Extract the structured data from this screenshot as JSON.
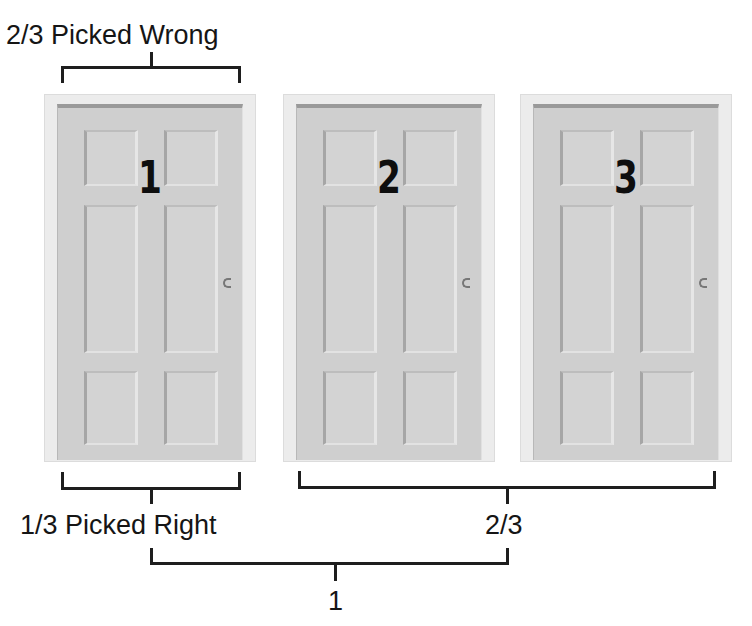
{
  "diagram": {
    "doors": [
      {
        "number": "1",
        "label": "Door 1"
      },
      {
        "number": "2",
        "label": "Door 2"
      },
      {
        "number": "3",
        "label": "Door 3"
      }
    ],
    "labels": {
      "top_door1": "2/3 Picked Wrong",
      "bottom_door1": "1/3 Picked Right",
      "bottom_doors23": "2/3",
      "total": "1"
    },
    "colors": {
      "door": "#cfcfcf",
      "frame": "#ececec",
      "bracket": "#1e1e1e",
      "text": "#151515"
    }
  }
}
